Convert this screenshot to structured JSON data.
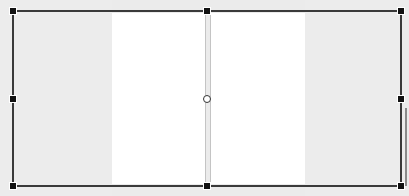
{
  "canvas": {
    "background_color": "#ebebeb",
    "side_panel_color": "#ececec",
    "page_color": "#ffffff",
    "frame_color": "#3a3a3a",
    "handle_color": "#111111"
  },
  "spread": {
    "pages": [
      {
        "name": "left-page"
      },
      {
        "name": "right-page"
      }
    ]
  },
  "selection": {
    "handles": [
      "top-left",
      "top-center",
      "top-right",
      "middle-left",
      "middle-right",
      "bottom-left",
      "bottom-center",
      "bottom-right"
    ],
    "center_marker": "rotation-center"
  }
}
